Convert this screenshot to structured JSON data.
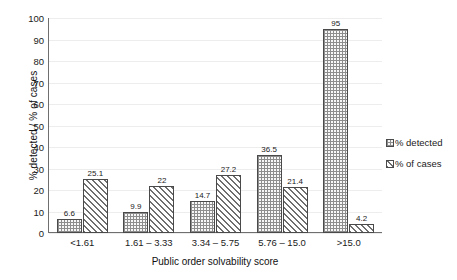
{
  "chart_data": {
    "type": "bar",
    "title": "",
    "xlabel": "Public order solvability score",
    "ylabel": "% detected / % of cases",
    "categories": [
      "<1.61",
      "1.61 – 3.33",
      "3.34 – 5.75",
      "5.76 – 15.0",
      ">15.0"
    ],
    "series": [
      {
        "name": "% detected",
        "values": [
          6.6,
          9.9,
          14.7,
          36.5,
          95
        ],
        "labels": [
          "6.6",
          "9.9",
          "14.7",
          "36.5",
          "95"
        ],
        "pattern": "dotted",
        "color": "#f7f7f7",
        "edge_color": "#4a4a4a"
      },
      {
        "name": "% of cases",
        "values": [
          25.1,
          22,
          27.2,
          21.4,
          4.2
        ],
        "labels": [
          "25.1",
          "22",
          "27.2",
          "21.4",
          "4.2"
        ],
        "pattern": "diagonal-hatch",
        "color": "#fafafa",
        "edge_color": "#6f6f6f"
      }
    ],
    "ylim": [
      0,
      100
    ],
    "yticks": [
      0,
      10,
      20,
      30,
      40,
      50,
      60,
      70,
      80,
      90,
      100
    ],
    "ytick_labels": [
      "0",
      "10",
      "20",
      "30",
      "40",
      "50",
      "60",
      "70",
      "80",
      "90",
      "100"
    ],
    "grid": true,
    "grid_axis": "y",
    "grid_color": "#ededed",
    "legend_position": "right",
    "legend_entries": [
      "% detected",
      "% of cases"
    ],
    "axis_color": "#6f6f6f",
    "background": "#ffffff"
  }
}
